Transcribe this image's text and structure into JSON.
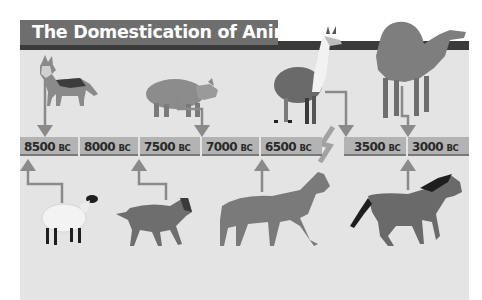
{
  "title": "The Domestication of Animals",
  "timeline": [
    {
      "year": "8500",
      "era": "BC",
      "left": 0,
      "width": 58
    },
    {
      "year": "8000",
      "era": "BC",
      "left": 60,
      "width": 58
    },
    {
      "year": "7500",
      "era": "BC",
      "left": 120,
      "width": 60
    },
    {
      "year": "7000",
      "era": "BC",
      "left": 182,
      "width": 57
    },
    {
      "year": "6500",
      "era": "BC",
      "left": 241,
      "width": 61
    },
    {
      "year": "3500",
      "era": "BC",
      "left": 324,
      "width": 62
    },
    {
      "year": "3000",
      "era": "BC",
      "left": 388,
      "width": 61
    }
  ],
  "animals_top": [
    {
      "name": "dog",
      "date": "8500 BC"
    },
    {
      "name": "pig",
      "date": "7000 BC"
    },
    {
      "name": "llama",
      "date": "3500 BC"
    },
    {
      "name": "camel",
      "date": "3000 BC"
    }
  ],
  "animals_bottom": [
    {
      "name": "sheep",
      "date": "8500 BC"
    },
    {
      "name": "goat",
      "date": "7500 BC"
    },
    {
      "name": "cattle",
      "date": "6500 BC"
    },
    {
      "name": "horse",
      "date": "3000 BC"
    }
  ]
}
